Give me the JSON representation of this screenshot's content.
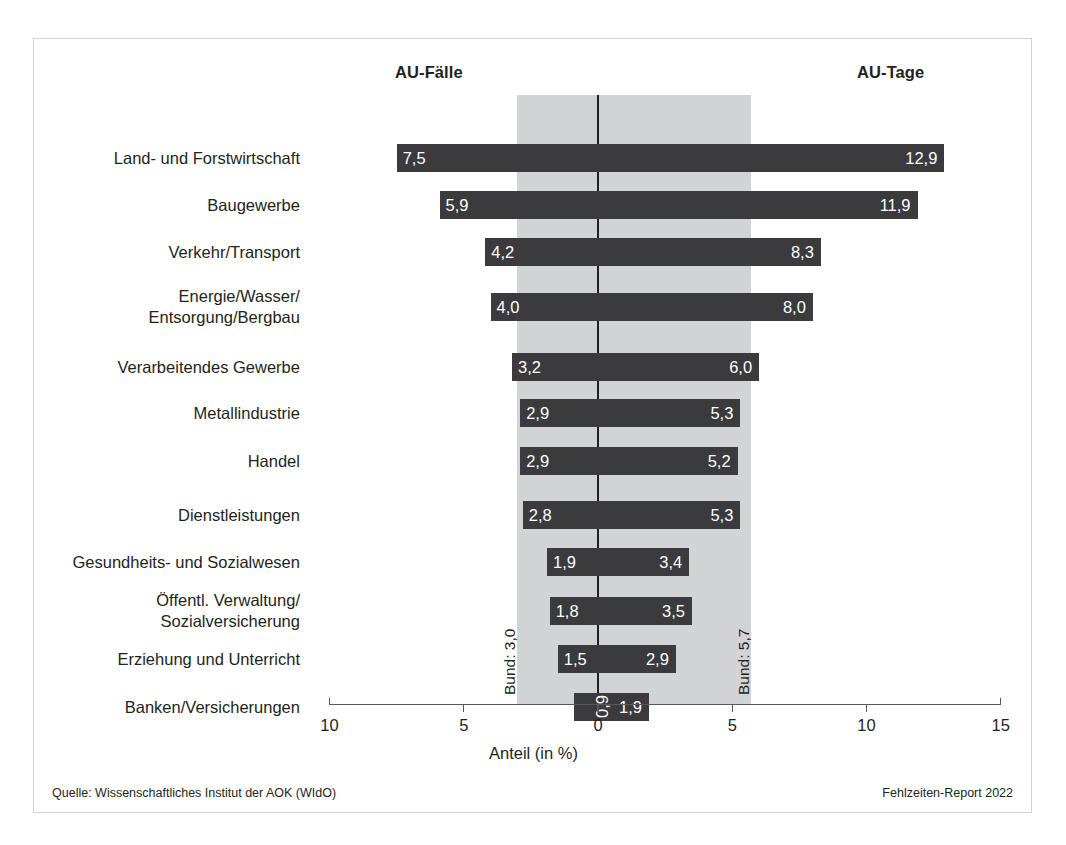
{
  "header": {
    "left_series_label": "AU-Fälle",
    "right_series_label": "AU-Tage"
  },
  "axis": {
    "title": "Anteil (in %)",
    "tick_labels": [
      "10",
      "5",
      "0",
      "5",
      "10",
      "15"
    ],
    "tick_values": [
      -10,
      -5,
      0,
      5,
      10,
      15
    ]
  },
  "annotations": {
    "bund_left": "Bund: 3,0",
    "bund_right": "Bund: 5,7"
  },
  "footer": {
    "source": "Quelle: Wissenschaftliches Institut der AOK (WIdO)",
    "report": "Fehlzeiten-Report 2022"
  },
  "colors": {
    "bar": "#3b3b3d",
    "band": "#d2d3d4",
    "zero_line": "#231f20",
    "axis": "#58595b",
    "frame": "#d2d2d2",
    "text": "#231f20",
    "value_text": "#ffffff"
  },
  "chart_data": {
    "type": "bar",
    "title": "",
    "subtitle": "",
    "xlabel": "Anteil (in %)",
    "ylabel": "",
    "xlim": [
      -10,
      15
    ],
    "grid": false,
    "legend_position": "top",
    "orientation": "horizontal-diverging",
    "categories": [
      "Land- und Forstwirtschaft",
      "Baugewerbe",
      "Verkehr/Transport",
      "Energie/Wasser/\nEntsorgung/Bergbau",
      "Verarbeitendes Gewerbe",
      "Metallindustrie",
      "Handel",
      "Dienstleistungen",
      "Gesundheits- und Sozialwesen",
      "Öffentl. Verwaltung/\nSozialversicherung",
      "Erziehung und Unterricht",
      "Banken/Versicherungen"
    ],
    "series": [
      {
        "name": "AU-Fälle",
        "direction": "left",
        "values": [
          7.5,
          5.9,
          4.2,
          4.0,
          3.2,
          2.9,
          2.9,
          2.8,
          1.9,
          1.8,
          1.5,
          0.9
        ],
        "labels": [
          "7,5",
          "5,9",
          "4,2",
          "4,0",
          "3,2",
          "2,9",
          "2,9",
          "2,8",
          "1,9",
          "1,8",
          "1,5",
          "0,9"
        ],
        "reference_line": 3.0,
        "reference_label": "Bund: 3,0"
      },
      {
        "name": "AU-Tage",
        "direction": "right",
        "values": [
          12.9,
          11.9,
          8.3,
          8.0,
          6.0,
          5.3,
          5.2,
          5.3,
          3.4,
          3.5,
          2.9,
          1.9
        ],
        "labels": [
          "12,9",
          "11,9",
          "8,3",
          "8,0",
          "6,0",
          "5,3",
          "5,2",
          "5,3",
          "3,4",
          "3,5",
          "2,9",
          "1,9"
        ],
        "reference_line": 5.7,
        "reference_label": "Bund: 5,7"
      }
    ]
  }
}
